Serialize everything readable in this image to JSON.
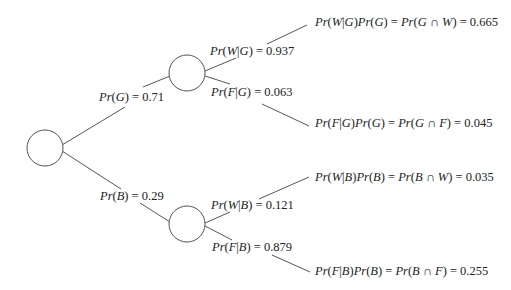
{
  "diagram": {
    "type": "probability-tree",
    "root": {
      "label": ""
    },
    "branches": [
      {
        "event": "G",
        "probability_label": {
          "expr": "Pr(G)",
          "value": "0.71"
        },
        "children": [
          {
            "event": "W",
            "conditional_label": {
              "expr": "Pr(W|G)",
              "value": "0.937"
            },
            "outcome_label": {
              "expr": "Pr(W|G)Pr(G) = Pr(G ∩ W)",
              "value": "0.665"
            }
          },
          {
            "event": "F",
            "conditional_label": {
              "expr": "Pr(F|G)",
              "value": "0.063"
            },
            "outcome_label": {
              "expr": "Pr(F|G)Pr(G) = Pr(G ∩ F)",
              "value": "0.045"
            }
          }
        ]
      },
      {
        "event": "B",
        "probability_label": {
          "expr": "Pr(B)",
          "value": "0.29"
        },
        "children": [
          {
            "event": "W",
            "conditional_label": {
              "expr": "Pr(W|B)",
              "value": "0.121"
            },
            "outcome_label": {
              "expr": "Pr(W|B)Pr(B) = Pr(B ∩ W)",
              "value": "0.035"
            }
          },
          {
            "event": "F",
            "conditional_label": {
              "expr": "Pr(F|B)",
              "value": "0.879"
            },
            "outcome_label": {
              "expr": "Pr(F|B)Pr(B) = Pr(B ∩ F)",
              "value": "0.255"
            }
          }
        ]
      }
    ]
  },
  "text": {
    "equals": "=",
    "b0": "Pr(G) = 0.71",
    "b1": "Pr(B) = 0.29",
    "b0c0": "Pr(W|G) = 0.937",
    "b0c1": "Pr(F|G) = 0.063",
    "b1c0": "Pr(W|B) = 0.121",
    "b1c1": "Pr(F|B) = 0.879",
    "o00": "Pr(W|G)Pr(G) = Pr(G ∩ W) = 0.665",
    "o01": "Pr(F|G)Pr(G) = Pr(G ∩ F) = 0.045",
    "o10": "Pr(W|B)Pr(B) = Pr(B ∩ W) = 0.035",
    "o11": "Pr(F|B)Pr(B) = Pr(B ∩ F) = 0.255"
  }
}
